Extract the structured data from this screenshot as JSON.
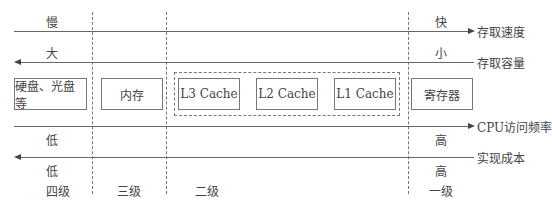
{
  "axes": [
    {
      "name": "access-speed",
      "label": "存取速度",
      "left_value": "慢",
      "right_value": "快",
      "direction": "right"
    },
    {
      "name": "capacity",
      "label": "存取容量",
      "left_value": "大",
      "right_value": "小",
      "direction": "left"
    },
    {
      "name": "cpu-access-frequency",
      "label": "CPU访问频率",
      "left_value": "低",
      "right_value": "高",
      "direction": "right"
    },
    {
      "name": "cost",
      "label": "实现成本",
      "left_value": "低",
      "right_value": "高",
      "direction": "left"
    }
  ],
  "storage": [
    {
      "label": "硬盘、光盘等"
    },
    {
      "label": "内存"
    },
    {
      "label": "L3 Cache"
    },
    {
      "label": "L2 Cache"
    },
    {
      "label": "L1 Cache"
    },
    {
      "label": "寄存器"
    }
  ],
  "levels": [
    "四级",
    "三级",
    "二级",
    "一级"
  ],
  "colors": {
    "line": "#666666",
    "text": "#444444",
    "background": "#ffffff"
  }
}
